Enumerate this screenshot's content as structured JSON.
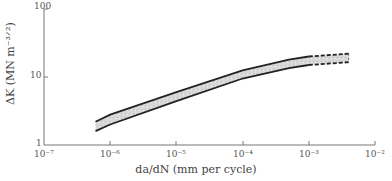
{
  "chart_data": {
    "type": "area",
    "title": "",
    "xlabel": "da/dN (mm per cycle)",
    "ylabel": "ΔK (MN m^-3/2)",
    "xscale": "log",
    "yscale": "log",
    "xlim": [
      1e-07,
      0.01
    ],
    "ylim": [
      1,
      100
    ],
    "x_ticks": [
      "10^-7",
      "10^-6",
      "10^-5",
      "10^-4",
      "10^-3",
      "10^-2"
    ],
    "y_ticks": [
      "1",
      "10",
      "100"
    ],
    "grid": false,
    "legend": null,
    "series": [
      {
        "name": "upper bound",
        "x": [
          6e-07,
          1e-06,
          1e-05,
          0.0001,
          0.0005,
          0.001,
          0.004
        ],
        "y": [
          2.2,
          2.8,
          6.0,
          12.5,
          18.0,
          20.0,
          22.0
        ],
        "style": "solid until 1e-3 then dashed"
      },
      {
        "name": "lower bound",
        "x": [
          6e-07,
          1e-06,
          1e-05,
          0.0001,
          0.0005,
          0.001,
          0.004
        ],
        "y": [
          1.6,
          2.0,
          4.4,
          9.5,
          13.5,
          15.0,
          16.5
        ],
        "style": "solid until 1e-3 then dashed"
      }
    ],
    "annotations": [
      "shaded scatter band between bounds"
    ]
  },
  "labels": {
    "xlabel": "da/dN (mm per cycle)",
    "ylabel": "ΔK (MN m⁻³ᐟ²)",
    "x_ticks": [
      "10⁻⁷",
      "10⁻⁶",
      "10⁻⁵",
      "10⁻⁴",
      "10⁻³",
      "10⁻²"
    ],
    "y_ticks": [
      "1",
      "10",
      "100"
    ]
  }
}
